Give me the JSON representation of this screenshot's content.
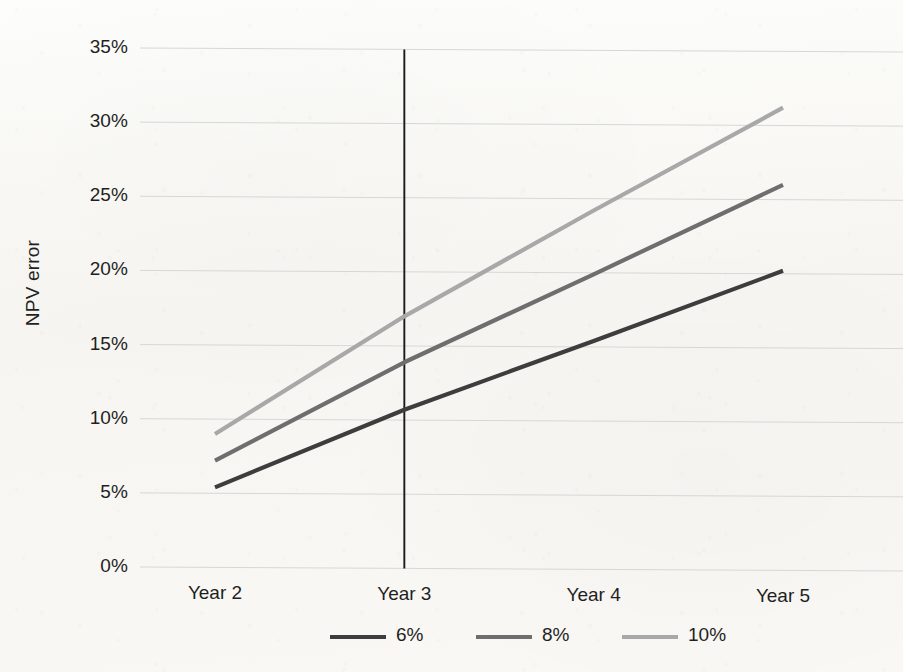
{
  "chart_data": {
    "type": "line",
    "title": "",
    "xlabel": "",
    "ylabel": "NPV error",
    "categories": [
      "Year 2",
      "Year 3",
      "Year 4",
      "Year 5"
    ],
    "ylim": [
      0,
      35
    ],
    "y_ticks": [
      0,
      5,
      10,
      15,
      20,
      25,
      30,
      35
    ],
    "y_tick_labels": [
      "0%",
      "5%",
      "10%",
      "15%",
      "20%",
      "25%",
      "30%",
      "35%"
    ],
    "grid": true,
    "legend_position": "bottom-center",
    "series": [
      {
        "name": "6%",
        "color": "#3d3d3d",
        "values": [
          5.4,
          10.7,
          15.4,
          20.2
        ]
      },
      {
        "name": "8%",
        "color": "#6e6e6e",
        "values": [
          7.2,
          13.9,
          19.9,
          26.0
        ]
      },
      {
        "name": "10%",
        "color": "#a8a8a8",
        "values": [
          9.0,
          17.0,
          24.2,
          31.2
        ]
      }
    ],
    "annotations": [
      {
        "name": "year-3-vertical-marker",
        "type": "vline",
        "x_category": "Year 3",
        "color": "#1a1a1a",
        "y_from": 0,
        "y_to": 35
      }
    ]
  },
  "axis": {
    "y_title": "NPV error",
    "y_tick_labels": [
      "35%",
      "30%",
      "25%",
      "20%",
      "15%",
      "10%",
      "5%",
      "0%"
    ],
    "x_tick_labels": [
      "Year 2",
      "Year 3",
      "Year 4",
      "Year 5"
    ]
  },
  "legend": {
    "items": [
      {
        "label": "6%",
        "color": "#3d3d3d"
      },
      {
        "label": "8%",
        "color": "#6e6e6e"
      },
      {
        "label": "10%",
        "color": "#a8a8a8"
      }
    ]
  },
  "colors": {
    "paper": "#faf9f6",
    "gridline": "#d7d7d7",
    "text": "#1f1f1f",
    "marker_line": "#1a1a1a"
  }
}
